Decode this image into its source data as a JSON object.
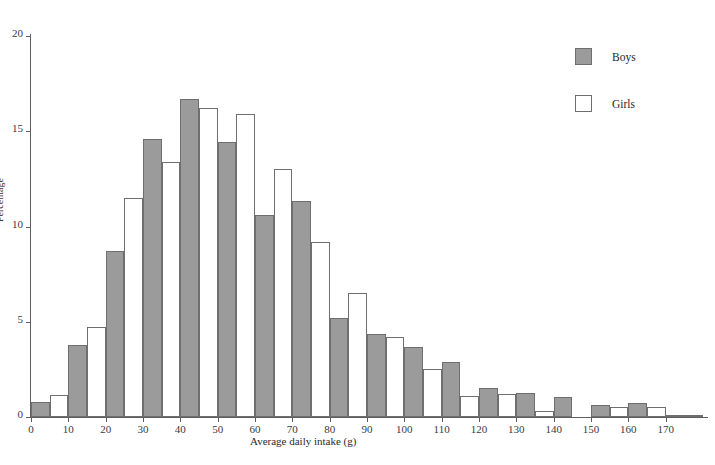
{
  "figure": {
    "caption_fragment": "",
    "legend_position": "top-right"
  },
  "legend": {
    "entries": [
      {
        "label": "Boys",
        "color": "#9b9b9b",
        "swatch": "filled-gray-square"
      },
      {
        "label": "Girls",
        "color": "#ffffff",
        "swatch": "open-white-square"
      }
    ]
  },
  "axes": {
    "y_label": "Percentage",
    "x_label": "Average daily intake (g)",
    "y_ticks": [
      "0",
      "5",
      "10",
      "15",
      "20"
    ],
    "x_ticks": [
      "0",
      "10",
      "20",
      "30",
      "40",
      "50",
      "60",
      "70",
      "80",
      "90",
      "100",
      "110",
      "120",
      "130",
      "140",
      "150",
      "160",
      "170"
    ]
  },
  "chart_data": {
    "type": "bar",
    "title": "",
    "subtitle": "",
    "xlabel": "Average daily intake (g)",
    "ylabel": "Percentage",
    "xlim": [
      0,
      180
    ],
    "ylim": [
      0,
      20
    ],
    "grid": false,
    "legend_position": "top-right",
    "bin_width": 10,
    "categories": [
      "0-10",
      "10-20",
      "20-30",
      "30-40",
      "40-50",
      "50-60",
      "60-70",
      "70-80",
      "80-90",
      "90-100",
      "100-110",
      "110-120",
      "120-130",
      "130-140",
      "140-150",
      "150-160",
      "160-170",
      "170-180"
    ],
    "bin_starts": [
      0,
      10,
      20,
      30,
      40,
      50,
      60,
      70,
      80,
      90,
      100,
      110,
      120,
      130,
      140,
      150,
      160,
      170
    ],
    "series": [
      {
        "name": "Boys",
        "color": "#9b9b9b",
        "values": [
          0.8,
          3.8,
          8.7,
          14.6,
          16.7,
          14.45,
          10.6,
          11.35,
          5.2,
          4.35,
          3.7,
          2.9,
          1.5,
          1.25,
          1.05,
          0.65,
          0.75,
          0.1
        ]
      },
      {
        "name": "Girls",
        "color": "#ffffff",
        "values": [
          1.15,
          4.7,
          11.5,
          13.4,
          16.2,
          15.9,
          13.0,
          9.2,
          6.5,
          4.2,
          2.5,
          1.1,
          1.2,
          0.3,
          0.0,
          0.55,
          0.55,
          0.1
        ]
      }
    ],
    "annotations": []
  }
}
